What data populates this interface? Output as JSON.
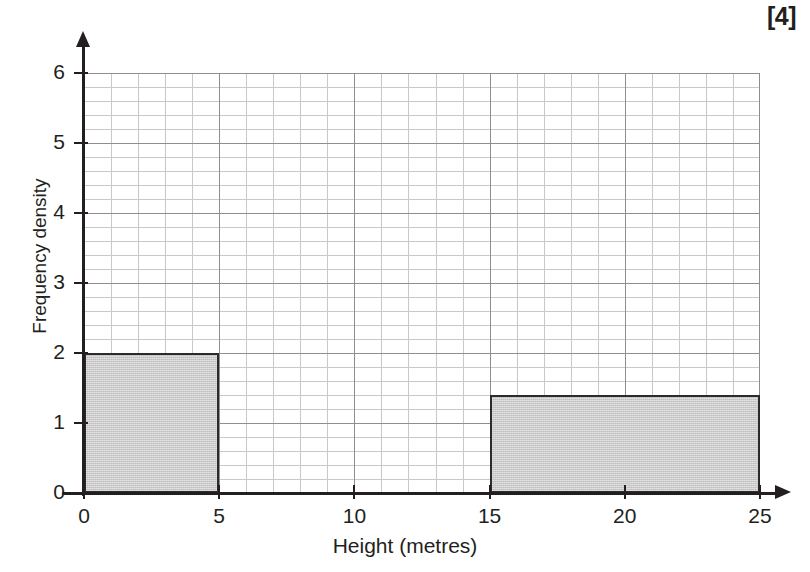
{
  "marks": "[4]",
  "chart_data": {
    "type": "bar",
    "title": "",
    "subtitle": "",
    "xlabel": "Height (metres)",
    "ylabel": "Frequency density",
    "xlim": [
      0,
      25
    ],
    "ylim": [
      0,
      6
    ],
    "xticks": [
      0,
      5,
      10,
      15,
      20,
      25
    ],
    "yticks": [
      0,
      1,
      2,
      3,
      4,
      5,
      6
    ],
    "xtick_labels": [
      "0",
      "5",
      "10",
      "15",
      "20",
      "25"
    ],
    "ytick_labels": [
      "0",
      "1",
      "2",
      "3",
      "4",
      "5",
      "6"
    ],
    "grid": true,
    "grid_minor_x": 1,
    "grid_minor_y": 0.2,
    "grid_major_x": 5,
    "grid_major_y": 1,
    "legend": "none",
    "bar_fill_color": "#cfcfcf",
    "bar_border_color": "#2b2b2b",
    "grid_major_color": "#8e8e91",
    "grid_minor_color": "#c8c8cb",
    "axis_color": "#231f20",
    "bins": [
      {
        "label": "0-5",
        "x_start": 0,
        "x_end": 5,
        "frequency_density": 2
      },
      {
        "label": "15-25",
        "x_start": 15,
        "x_end": 25,
        "frequency_density": 1.4
      }
    ]
  }
}
